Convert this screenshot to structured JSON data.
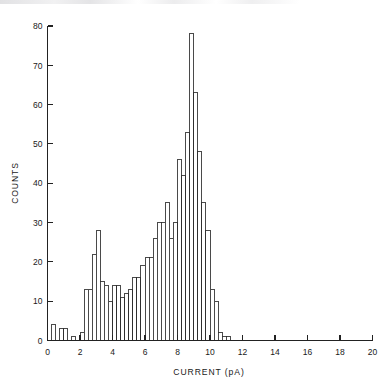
{
  "chart_data": {
    "type": "bar",
    "title": "",
    "xlabel": "CURRENT (pA)",
    "ylabel": "COUNTS",
    "xlim": [
      0,
      20
    ],
    "ylim": [
      0,
      80
    ],
    "xticks": [
      0,
      2,
      4,
      6,
      8,
      10,
      12,
      14,
      16,
      18,
      20
    ],
    "xticklabels": [
      "0",
      "2",
      "4",
      "6",
      "8",
      "10",
      "12",
      "14",
      "16",
      "18",
      "20"
    ],
    "yticks": [
      0,
      10,
      20,
      30,
      40,
      50,
      60,
      70,
      80
    ],
    "yticklabels": [
      "0",
      "10",
      "20",
      "30",
      "40",
      "50",
      "60",
      "70",
      "80"
    ],
    "grid": false,
    "legend": null,
    "bin_width": 0.25,
    "categories": [
      0.375,
      0.625,
      0.875,
      1.125,
      1.375,
      1.625,
      1.875,
      2.125,
      2.375,
      2.625,
      2.875,
      3.125,
      3.375,
      3.625,
      3.875,
      4.125,
      4.375,
      4.625,
      4.875,
      5.125,
      5.375,
      5.625,
      5.875,
      6.125,
      6.375,
      6.625,
      6.875,
      7.125,
      7.375,
      7.625,
      7.875,
      8.125,
      8.375,
      8.625,
      8.875,
      9.125,
      9.375,
      9.625,
      9.875,
      10.125,
      10.375,
      10.625,
      10.875,
      11.125,
      11.375,
      11.625,
      11.875,
      12.125,
      12.375,
      12.625,
      12.875,
      13.125
    ],
    "values": [
      4,
      0,
      3,
      3,
      0,
      1,
      0,
      2,
      13,
      13,
      22,
      28,
      15,
      14,
      10,
      14,
      14,
      11,
      12,
      13,
      16,
      16,
      19,
      21,
      21,
      26,
      30,
      30,
      35,
      26,
      30,
      46,
      42,
      53,
      78,
      63,
      48,
      35,
      28,
      13,
      10,
      2,
      1,
      1,
      0,
      0,
      0,
      0,
      0,
      0,
      0,
      0
    ]
  },
  "axes": {
    "x_title": "CURRENT (pA)",
    "y_title": "COUNTS"
  }
}
